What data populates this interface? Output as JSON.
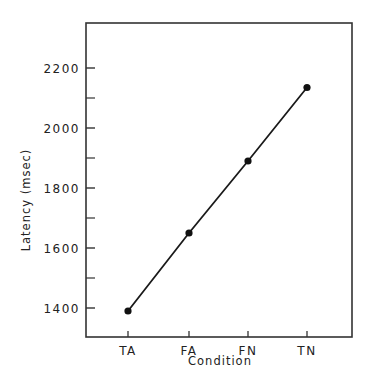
{
  "chart_data": {
    "type": "line",
    "title": "",
    "xlabel": "Condition",
    "ylabel": "Latency (msec)",
    "categories": [
      "TA",
      "FA",
      "FN",
      "TN"
    ],
    "series": [
      {
        "name": "Latency",
        "values": [
          1390,
          1650,
          1890,
          2135
        ]
      }
    ],
    "ylim": [
      1300,
      2330
    ],
    "yticks_major": [
      1400,
      1600,
      1800,
      2000,
      2200
    ],
    "yticks_minor": [
      1500,
      1700,
      1900,
      2100
    ],
    "grid": false,
    "legend": null,
    "marker": "filled-circle",
    "colors": {
      "line": "#1a1a1a",
      "axis": "#333333",
      "background": "#ffffff"
    }
  },
  "labels": {
    "ytick_labels": [
      "1400",
      "1600",
      "1800",
      "2000",
      "2200"
    ],
    "xtick_labels": [
      "TA",
      "FA",
      "FN",
      "TN"
    ],
    "xlabel": "Condition",
    "ylabel": "Latency (msec)"
  }
}
